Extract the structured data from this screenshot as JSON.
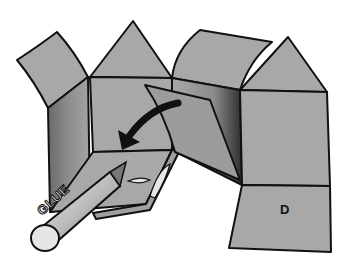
{
  "diagram": {
    "labels": {
      "face_label": "D",
      "glue_stick_text": "GLUE"
    },
    "icons": [
      "curved-fold-arrow-icon",
      "glue-stick-icon",
      "glue-drop-icon"
    ],
    "colors": {
      "panel": "#a8a8a8",
      "panel_dark": "#8a8a8a",
      "shadow": "#3a3a3a",
      "outline": "#111111",
      "background": "#ffffff",
      "glue_body": "#c8c8c8"
    }
  }
}
